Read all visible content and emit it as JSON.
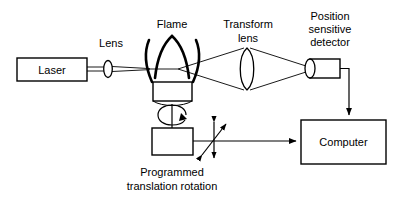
{
  "figure": {
    "type": "optical-schematic",
    "background_color": "#ffffff",
    "line_color": "#000000"
  },
  "labels": {
    "laser": "Laser",
    "lens": "Lens",
    "flame": "Flame",
    "transform_lens_line1": "Transform",
    "transform_lens_line2": "lens",
    "detector_line1": "Position",
    "detector_line2": "sensitive",
    "detector_line3": "detector",
    "computer": "Computer",
    "stage_line1": "Programmed",
    "stage_line2": "translation rotation"
  },
  "components": [
    {
      "name": "laser-source",
      "label": "Laser",
      "shape": "rectangle"
    },
    {
      "name": "collimating-lens",
      "label": "Lens",
      "shape": "ellipse"
    },
    {
      "name": "flame",
      "label": "Flame",
      "shape": "flame-arcs"
    },
    {
      "name": "burner-head",
      "label": "",
      "shape": "rectangle"
    },
    {
      "name": "transform-lens",
      "label": "Transform lens",
      "shape": "biconvex-lens"
    },
    {
      "name": "position-sensitive-detector",
      "label": "Position sensitive detector",
      "shape": "cylinder"
    },
    {
      "name": "translation-stage",
      "label": "Programmed translation rotation",
      "shape": "rectangle"
    },
    {
      "name": "computer",
      "label": "Computer",
      "shape": "rectangle"
    }
  ],
  "connections": [
    {
      "name": "beam-path",
      "from": "laser-source",
      "to": "position-sensitive-detector",
      "style": "optical-ray"
    },
    {
      "name": "detector-to-computer",
      "from": "position-sensitive-detector",
      "to": "computer",
      "style": "arrow"
    },
    {
      "name": "stage-to-computer",
      "from": "translation-stage",
      "to": "computer",
      "style": "arrow"
    }
  ],
  "motion_indicators": [
    {
      "name": "rotation-arrow",
      "kind": "rotation",
      "target": "burner-head"
    },
    {
      "name": "translation-arrows",
      "kind": "translation",
      "target": "translation-stage"
    }
  ]
}
